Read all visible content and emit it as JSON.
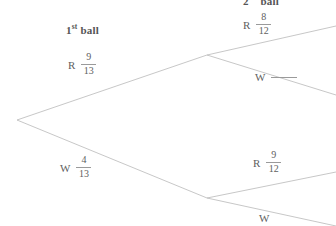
{
  "diagram": {
    "type": "probability-tree",
    "title_visible": false,
    "background_color": "#ffffff",
    "line_color": "#b9b9b9",
    "text_color": "#5a5a5a",
    "headers": {
      "first": {
        "text": "1st ball",
        "base": "1",
        "sup": "st",
        "rest": " ball"
      },
      "second": {
        "text": "2nd ball",
        "base": "2",
        "sup": "nd",
        "rest": " ball",
        "clipped": "top"
      }
    },
    "nodes": {
      "root": {
        "x": 17,
        "y": 120
      },
      "first_red": {
        "x": 207,
        "y": 55
      },
      "first_white": {
        "x": 207,
        "y": 198
      }
    },
    "branches": [
      {
        "id": "first-red",
        "stage": 1,
        "outcome": "R",
        "letter": "R",
        "numerator": "9",
        "denominator": "13",
        "blank": false,
        "from": "root",
        "to": "first_red"
      },
      {
        "id": "first-white",
        "stage": 1,
        "outcome": "W",
        "letter": "W",
        "numerator": "4",
        "denominator": "13",
        "blank": false,
        "from": "root",
        "to": "first_white"
      },
      {
        "id": "second-red-red",
        "stage": 2,
        "outcome": "R",
        "letter": "R",
        "numerator": "8",
        "denominator": "12",
        "blank": false,
        "from": "first_red",
        "to": "off-right-edge-top"
      },
      {
        "id": "second-red-white",
        "stage": 2,
        "outcome": "W",
        "letter": "W",
        "numerator": "",
        "denominator": "",
        "blank": true,
        "from": "first_red",
        "to": "off-right-edge-upper-mid"
      },
      {
        "id": "second-white-red",
        "stage": 2,
        "outcome": "R",
        "letter": "R",
        "numerator": "9",
        "denominator": "12",
        "blank": false,
        "from": "first_white",
        "to": "off-right-edge-lower-mid"
      },
      {
        "id": "second-white-white",
        "stage": 2,
        "outcome": "W",
        "letter": "W",
        "numerator": "",
        "denominator": "",
        "blank": true,
        "clipped": "bottom",
        "from": "first_white",
        "to": "off-right-edge-bottom"
      }
    ]
  }
}
